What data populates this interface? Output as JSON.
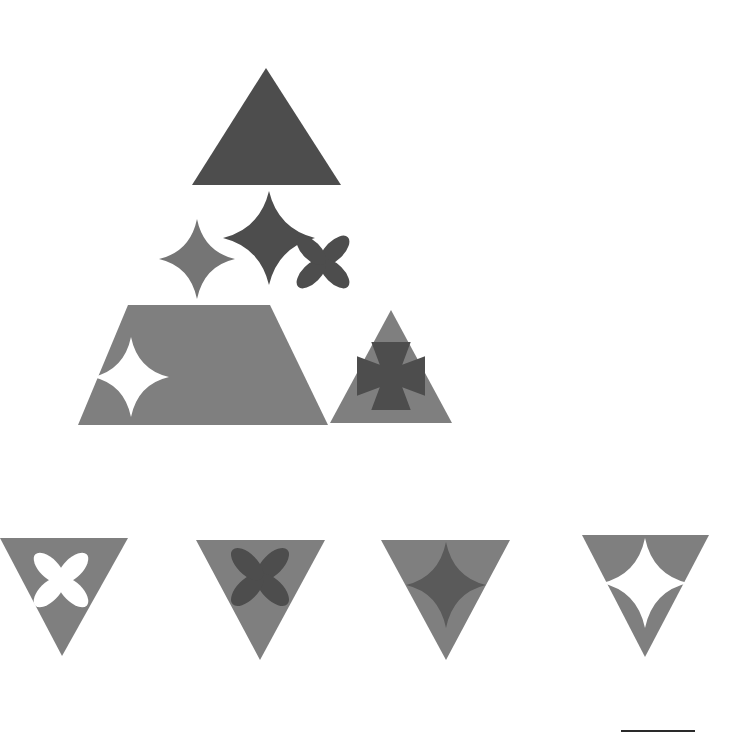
{
  "canvas": {
    "width": 736,
    "height": 734,
    "background_color": "#ffffff",
    "title": "Abstract geometric shape composition"
  },
  "palette": {
    "dark_gray": "#4d4d4d",
    "medium_gray": "#7f7f7f",
    "mid_gray_star": "#757575",
    "white": "#ffffff",
    "artifact_line": "#2a2a2a"
  },
  "chart_data": {
    "type": "scatter",
    "xlabel": "",
    "ylabel": "",
    "xlim": [
      0,
      736
    ],
    "ylim": [
      0,
      734
    ],
    "grid": false,
    "legend": "none",
    "categories": [
      "triangle-up",
      "four-point-star",
      "four-petal-flower",
      "trapezoid",
      "flared-cross",
      "triangle-down"
    ],
    "values": [
      2,
      5,
      3,
      1,
      1,
      4
    ],
    "annotations": [
      "apex triangle dark gray",
      "middle row: two stars and one flower",
      "base row: trapezoid with white star, triangle with dark cross",
      "bottom row: four inverted triangles with inner motifs"
    ]
  },
  "shapes": [
    {
      "id": "apex-triangle",
      "name": "triangle-up-dark",
      "type": "triangle-up",
      "fill": "#4d4d4d",
      "points": "266,68 341,185 192,185",
      "label": "Apex dark triangle"
    },
    {
      "id": "mid-star-left",
      "name": "four-point-star-medium",
      "type": "four-point-star",
      "fill": "#757575",
      "cx": 197,
      "cy": 259,
      "rx": 38,
      "ry": 40,
      "waist": 0.2,
      "label": "Left medium four-point star"
    },
    {
      "id": "mid-star-center",
      "name": "four-point-star-dark",
      "type": "four-point-star",
      "fill": "#4d4d4d",
      "cx": 269,
      "cy": 238,
      "rx": 46,
      "ry": 47,
      "waist": 0.22,
      "label": "Center dark four-point star"
    },
    {
      "id": "mid-flower-right",
      "name": "four-petal-flower-dark",
      "type": "four-petal-flower",
      "fill": "#4d4d4d",
      "cx": 323,
      "cy": 262,
      "r": 30,
      "rotation": 45,
      "label": "Right dark four-petal flower"
    },
    {
      "id": "base-trapezoid",
      "name": "trapezoid-medium",
      "type": "trapezoid",
      "fill": "#7f7f7f",
      "points": "128,305 270,305 328,425 78,425",
      "label": "Base medium trapezoid"
    },
    {
      "id": "trapezoid-star",
      "name": "four-point-star-white",
      "type": "four-point-star",
      "fill": "#ffffff",
      "cx": 131,
      "cy": 377,
      "rx": 38,
      "ry": 40,
      "waist": 0.2,
      "label": "White star inside trapezoid"
    },
    {
      "id": "base-triangle",
      "name": "triangle-up-medium",
      "type": "triangle-up",
      "fill": "#7f7f7f",
      "points": "391,310 452,423 330,423",
      "label": "Base medium triangle"
    },
    {
      "id": "base-triangle-cross",
      "name": "flared-cross-dark",
      "type": "flared-cross",
      "fill": "#4d4d4d",
      "cx": 391,
      "cy": 376,
      "size": 34,
      "label": "Dark flared cross inside triangle"
    },
    {
      "id": "bottom-tri-1",
      "name": "triangle-down-medium-1",
      "type": "triangle-down",
      "fill": "#7f7f7f",
      "points": "0,538 128,538 62,656",
      "label": "Bottom inverted triangle 1"
    },
    {
      "id": "bottom-tri-1-flower",
      "name": "four-petal-flower-white",
      "type": "four-petal-flower",
      "fill": "#ffffff",
      "cx": 61,
      "cy": 580,
      "r": 31,
      "rotation": 45,
      "label": "White flower in inverted triangle 1"
    },
    {
      "id": "bottom-tri-2",
      "name": "triangle-down-medium-2",
      "type": "triangle-down",
      "fill": "#7f7f7f",
      "points": "196,540 325,540 260,660",
      "label": "Bottom inverted triangle 2"
    },
    {
      "id": "bottom-tri-2-flower",
      "name": "four-petal-flower-dark",
      "type": "four-petal-flower",
      "fill": "#4d4d4d",
      "cx": 260,
      "cy": 577,
      "r": 33,
      "rotation": 45,
      "label": "Dark flower in inverted triangle 2"
    },
    {
      "id": "bottom-tri-3",
      "name": "triangle-down-medium-3",
      "type": "triangle-down",
      "fill": "#7f7f7f",
      "points": "381,540 510,540 446,660",
      "label": "Bottom inverted triangle 3"
    },
    {
      "id": "bottom-tri-3-star",
      "name": "four-point-star-dark",
      "type": "four-point-star",
      "fill": "#5a5a5a",
      "cx": 446,
      "cy": 585,
      "rx": 40,
      "ry": 43,
      "waist": 0.2,
      "label": "Dark star in inverted triangle 3"
    },
    {
      "id": "bottom-tri-4",
      "name": "triangle-down-medium-4",
      "type": "triangle-down",
      "fill": "#7f7f7f",
      "points": "582,535 709,535 645,657",
      "label": "Bottom inverted triangle 4"
    },
    {
      "id": "bottom-tri-4-star",
      "name": "four-point-star-white",
      "type": "four-point-star",
      "fill": "#ffffff",
      "cx": 645,
      "cy": 583,
      "rx": 43,
      "ry": 45,
      "waist": 0.2,
      "label": "White star in inverted triangle 4"
    }
  ],
  "artifact": {
    "name": "bottom-edge-line",
    "x": 621,
    "y": 730,
    "width": 74,
    "height": 2,
    "fill": "#2a2a2a"
  }
}
